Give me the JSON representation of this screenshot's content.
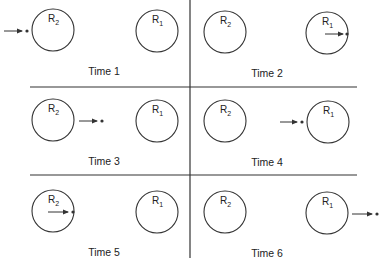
{
  "diagram": {
    "type": "sequence-panels",
    "colors": {
      "stroke": "#333333",
      "background": "#ffffff",
      "text": "#222222"
    },
    "panels": [
      {
        "label": "Time 1",
        "receptors": [
          {
            "name": "R",
            "sub": "2",
            "cx": 53,
            "cy": 30
          },
          {
            "name": "R",
            "sub": "1",
            "cx": 157,
            "cy": 31
          }
        ],
        "stimulus": {
          "description": "dot approaching R2 from the left",
          "x1": 4,
          "x2": 22,
          "dot_x": 27,
          "y": 31
        },
        "label_pos": {
          "x": 104,
          "y": 75
        }
      },
      {
        "label": "Time 2",
        "receptors": [
          {
            "name": "R",
            "sub": "2",
            "cx": 225,
            "cy": 32
          },
          {
            "name": "R",
            "sub": "1",
            "cx": 327,
            "cy": 33
          }
        ],
        "stimulus": {
          "description": "dot inside R1 at right edge",
          "x1": 325,
          "x2": 343,
          "dot_x": 347,
          "y": 34
        },
        "label_pos": {
          "x": 267,
          "y": 77
        }
      },
      {
        "label": "Time 3",
        "receptors": [
          {
            "name": "R",
            "sub": "2",
            "cx": 53,
            "cy": 120
          },
          {
            "name": "R",
            "sub": "1",
            "cx": 157,
            "cy": 121
          }
        ],
        "stimulus": {
          "description": "dot between R2 and R1",
          "x1": 79,
          "x2": 97,
          "dot_x": 102,
          "y": 121
        },
        "label_pos": {
          "x": 104,
          "y": 165
        }
      },
      {
        "label": "Time 4",
        "receptors": [
          {
            "name": "R",
            "sub": "2",
            "cx": 225,
            "cy": 121
          },
          {
            "name": "R",
            "sub": "1",
            "cx": 328,
            "cy": 122
          }
        ],
        "stimulus": {
          "description": "dot approaching R1 from the left",
          "x1": 280,
          "x2": 297,
          "dot_x": 302,
          "y": 122
        },
        "label_pos": {
          "x": 267,
          "y": 166
        }
      },
      {
        "label": "Time 5",
        "receptors": [
          {
            "name": "R",
            "sub": "2",
            "cx": 53,
            "cy": 211
          },
          {
            "name": "R",
            "sub": "1",
            "cx": 157,
            "cy": 212
          }
        ],
        "stimulus": {
          "description": "dot inside R2 at right edge",
          "x1": 48,
          "x2": 68,
          "dot_x": 73,
          "y": 212
        },
        "label_pos": {
          "x": 104,
          "y": 256
        }
      },
      {
        "label": "Time 6",
        "receptors": [
          {
            "name": "R",
            "sub": "2",
            "cx": 225,
            "cy": 212
          },
          {
            "name": "R",
            "sub": "1",
            "cx": 327,
            "cy": 213
          }
        ],
        "stimulus": {
          "description": "dot leaving R1 to the right",
          "x1": 352,
          "x2": 372,
          "dot_x": 377,
          "y": 214
        },
        "label_pos": {
          "x": 267,
          "y": 257
        }
      }
    ],
    "receptor_radius": 21,
    "dividers": {
      "vertical": {
        "x": 190,
        "y1": 0,
        "y2": 258
      },
      "horizontal": [
        {
          "y": 87,
          "x1": 30,
          "x2": 357
        },
        {
          "y": 175,
          "x1": 30,
          "x2": 357
        }
      ]
    }
  }
}
